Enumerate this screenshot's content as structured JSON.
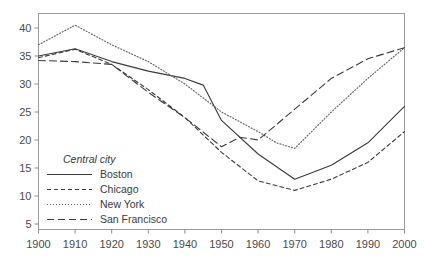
{
  "chart_data": {
    "type": "line",
    "title": "",
    "subtitle": "",
    "xlabel": "",
    "ylabel": "",
    "xlim": [
      1900,
      2000
    ],
    "ylim": [
      0,
      43
    ],
    "grid": false,
    "legend_position": "inside-lower-left",
    "legend_title": "Central city",
    "x": [
      1900,
      1910,
      1920,
      1930,
      1940,
      1950,
      1960,
      1970,
      1980,
      1990,
      2000
    ],
    "xticks": [
      "1900",
      "1910",
      "1920",
      "1930",
      "1940",
      "1950",
      "1960",
      "1970",
      "1980",
      "1990",
      "2000"
    ],
    "yticks": [
      "5",
      "10",
      "15",
      "20",
      "25",
      "30",
      "35",
      "40"
    ],
    "ytick_values": [
      5,
      10,
      15,
      20,
      25,
      30,
      35,
      40
    ],
    "series": [
      {
        "name": "Boston",
        "style": "solid",
        "color": "#3a3a3a",
        "values": [
          35.0,
          36.3,
          34.0,
          32.3,
          31.0,
          29.8,
          23.5,
          17.5,
          13.0,
          15.5,
          19.5,
          26.0
        ],
        "x": [
          1900,
          1910,
          1920,
          1930,
          1940,
          1945,
          1950,
          1960,
          1970,
          1980,
          1990,
          2000
        ]
      },
      {
        "name": "Chicago",
        "style": "dashed",
        "color": "#3a3a3a",
        "values": [
          34.7,
          36.2,
          33.5,
          29.0,
          24.0,
          17.8,
          12.7,
          11.0,
          13.0,
          16.0,
          21.5
        ],
        "x": [
          1900,
          1910,
          1920,
          1930,
          1940,
          1950,
          1960,
          1970,
          1980,
          1990,
          2000
        ]
      },
      {
        "name": "New York",
        "style": "dotted",
        "color": "#6a6a6a",
        "values": [
          37.0,
          40.5,
          37.0,
          34.0,
          30.0,
          25.0,
          21.5,
          19.5,
          18.5,
          25.0,
          31.0,
          36.5
        ],
        "x": [
          1900,
          1910,
          1920,
          1930,
          1940,
          1950,
          1960,
          1965,
          1970,
          1980,
          1990,
          2000
        ]
      },
      {
        "name": "San Francisco",
        "style": "longdash",
        "color": "#3a3a3a",
        "values": [
          34.2,
          34.0,
          33.5,
          28.5,
          24.0,
          18.8,
          20.5,
          20.0,
          25.5,
          31.0,
          34.5,
          36.5
        ],
        "x": [
          1900,
          1910,
          1920,
          1930,
          1940,
          1950,
          1955,
          1960,
          1970,
          1980,
          1990,
          2000
        ]
      }
    ],
    "legend_entries": [
      {
        "label": "Boston",
        "style": "solid"
      },
      {
        "label": "Chicago",
        "style": "dashed"
      },
      {
        "label": "New York",
        "style": "dotted"
      },
      {
        "label": "San Francisco",
        "style": "longdash"
      }
    ],
    "axis_color": "#8a8a8a"
  }
}
